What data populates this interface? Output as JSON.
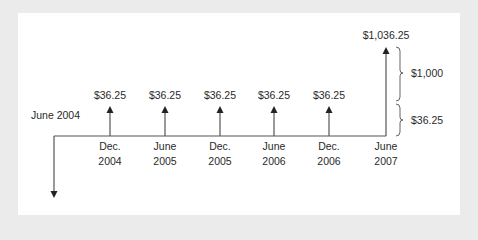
{
  "diagram": {
    "start_label": "June 2004",
    "line_color": "#555555",
    "text_color": "#2a2a2a",
    "coupon_payments": [
      {
        "amount": "$36.25",
        "date_line1": "Dec.",
        "date_line2": "2004"
      },
      {
        "amount": "$36.25",
        "date_line1": "June",
        "date_line2": "2005"
      },
      {
        "amount": "$36.25",
        "date_line1": "Dec.",
        "date_line2": "2005"
      },
      {
        "amount": "$36.25",
        "date_line1": "June",
        "date_line2": "2006"
      },
      {
        "amount": "$36.25",
        "date_line1": "Dec.",
        "date_line2": "2006"
      }
    ],
    "final_payment": {
      "amount": "$1,036.25",
      "date_line1": "June",
      "date_line2": "2007",
      "components": [
        {
          "label": "$1,000"
        },
        {
          "label": "$36.25"
        }
      ]
    }
  }
}
